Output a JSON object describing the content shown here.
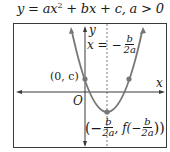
{
  "title": {
    "lhs": "y = ax",
    "exp": "2",
    "rhs": " + bx + c,  a > 0"
  },
  "labels": {
    "y_axis": "y",
    "x_axis": "x",
    "origin": "O",
    "y_intercept": "(0, c)",
    "axis_of_symmetry_prefix": "x = −",
    "axis_num": "b",
    "axis_den": "2a",
    "vertex_open": "(−",
    "vertex_mid": ", f(−",
    "vertex_close": "))",
    "vertex_num": "b",
    "vertex_den": "2a"
  },
  "colors": {
    "frame": "#3a3a3a",
    "curve": "#777777",
    "point": "#777777",
    "text": "#1a1a1a"
  }
}
